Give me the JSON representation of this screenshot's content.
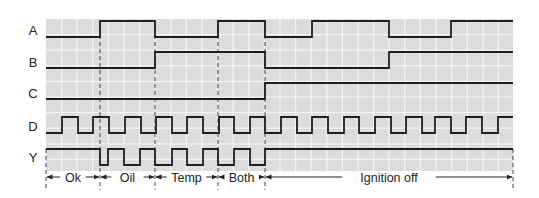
{
  "colors": {
    "grid_bg": "#dcdcdc",
    "grid_line": "#f4f4f4",
    "trace": "#1e1e1e",
    "marker": "#444444",
    "text": "#222222"
  },
  "grid": {
    "x0": 46,
    "x1": 513,
    "y0": 19,
    "y1": 171,
    "cell": 15.6
  },
  "signals": [
    {
      "name": "A",
      "label_y": 30,
      "high_y": 21,
      "low_y": 37,
      "initial": 0,
      "edges": [
        100,
        155,
        218,
        265,
        312,
        389,
        451
      ]
    },
    {
      "name": "B",
      "label_y": 62,
      "high_y": 52,
      "low_y": 68,
      "initial": 0,
      "edges": [
        155,
        265,
        389
      ]
    },
    {
      "name": "C",
      "label_y": 93,
      "high_y": 83,
      "low_y": 99,
      "initial": 0,
      "edges": [
        265
      ]
    },
    {
      "name": "D",
      "label_y": 126,
      "high_y": 117,
      "low_y": 133,
      "initial": 0,
      "edges": [
        62,
        78,
        93,
        109,
        125,
        141,
        156,
        172,
        187,
        203,
        219,
        234,
        250,
        265,
        281,
        297,
        312,
        328,
        344,
        359,
        375,
        391,
        406,
        422,
        435,
        451,
        466,
        482,
        498
      ]
    },
    {
      "name": "Y",
      "label_y": 157,
      "high_y": 149,
      "low_y": 165,
      "initial": 1,
      "edges": [
        100,
        108,
        124,
        140,
        155,
        172,
        187,
        203,
        218,
        234,
        250,
        265
      ]
    }
  ],
  "markers": [
    46,
    100,
    155,
    218,
    265,
    513
  ],
  "segments": [
    {
      "label": "Ok",
      "from": 46,
      "to": 100
    },
    {
      "label": "Oil",
      "from": 100,
      "to": 155
    },
    {
      "label": "Temp",
      "from": 155,
      "to": 218
    },
    {
      "label": "Both",
      "from": 218,
      "to": 265
    },
    {
      "label": "Ignition off",
      "from": 265,
      "to": 513
    }
  ],
  "segment_row_y": 177,
  "marker_bottom_y": 190
}
